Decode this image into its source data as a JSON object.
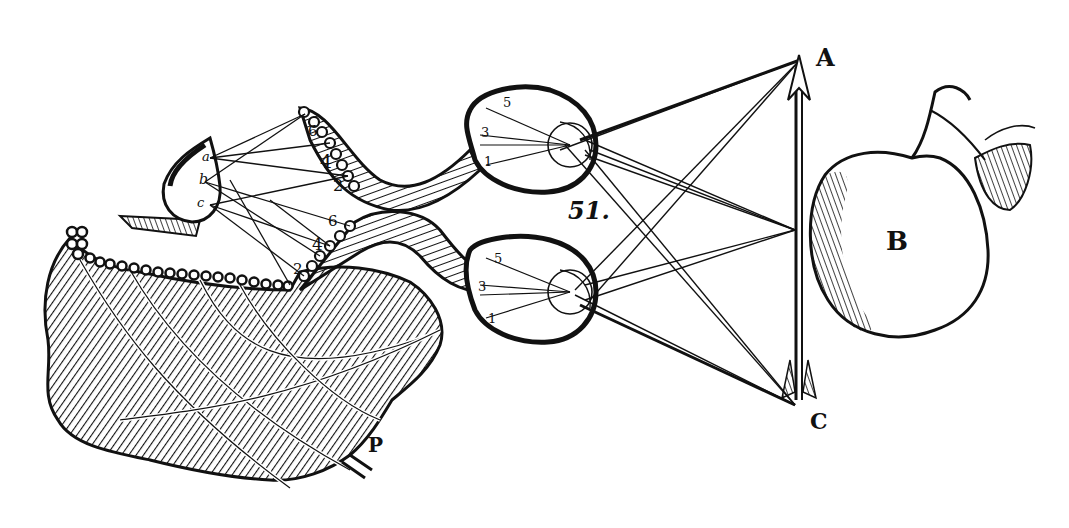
{
  "figure": {
    "number_label": "51.",
    "style": "black-and-white woodcut engraving"
  },
  "labels": {
    "A": "A",
    "B": "B",
    "C": "C",
    "P": "P"
  },
  "eye_top": {
    "points": [
      "5",
      "3",
      "1"
    ]
  },
  "eye_bottom": {
    "points": [
      "5",
      "3",
      "1"
    ]
  },
  "optic_tube_top": {
    "points": [
      "6",
      "4",
      "2"
    ]
  },
  "optic_tube_bottom": {
    "points": [
      "6",
      "4",
      "2"
    ]
  },
  "pineal_gland": {
    "points": [
      "a",
      "b",
      "c"
    ]
  },
  "objects": {
    "arrow": "arrow-AC",
    "apple": "apple-B"
  },
  "colors": {
    "ink": "#111111",
    "paper": "#ffffff"
  }
}
